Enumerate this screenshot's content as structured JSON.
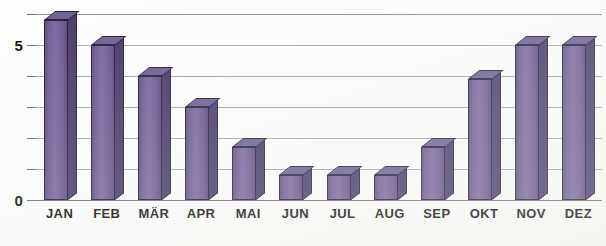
{
  "chart_data": {
    "type": "bar",
    "title": "",
    "subtitle": "",
    "xlabel": "",
    "ylabel": "",
    "categories": [
      "JAN",
      "FEB",
      "MÄR",
      "APR",
      "MAI",
      "JUN",
      "JUL",
      "AUG",
      "SEP",
      "OKT",
      "NOV",
      "DEZ"
    ],
    "values": [
      5.8,
      5.0,
      4.0,
      3.0,
      1.7,
      0.8,
      0.8,
      0.8,
      1.7,
      3.9,
      5.0,
      5.0
    ],
    "ylim": [
      0,
      6
    ],
    "y_tick_values": [
      0,
      1,
      2,
      3,
      4,
      5,
      6
    ],
    "y_tick_labels": [
      "0",
      "",
      "",
      "",
      "",
      "5",
      ""
    ],
    "labeled_y_ticks": [
      {
        "value": 0,
        "label": "0"
      },
      {
        "value": 5,
        "label": "5"
      }
    ],
    "grid": true,
    "grid_axis": "y",
    "legend": false,
    "legend_position": "none",
    "annotations": [],
    "bar_style": "3d",
    "bar_face_color": "#7a68a0",
    "bar_side_color": "#4a3a6b",
    "bar_top_color": "#6e5f93",
    "bar_outline_color": "#241a3d",
    "gridline_color": "#a8a8ac",
    "axis_color": "#6e6e72",
    "background_color": "#fdfdfc",
    "text_color": "#0d0d0d"
  }
}
